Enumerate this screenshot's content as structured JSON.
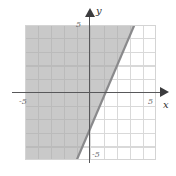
{
  "figure": {
    "kind": "cartesian-graph",
    "background_color": "#ffffff",
    "grid_color": "#d9d9d9",
    "axis_color": "#58585a",
    "line_color": "#8a8a8c",
    "shade_color": "#a8a8a8"
  },
  "axes": {
    "x_label": "x",
    "y_label": "y",
    "x_ticks": [
      "-5",
      "5"
    ],
    "y_ticks": [
      "5",
      "-5"
    ],
    "x_label_left": "-5",
    "x_label_right": "5",
    "y_label_top": "5",
    "y_label_bottom": "-5",
    "xlim": [
      -5,
      5
    ],
    "ylim": [
      -5,
      5
    ],
    "grid": true,
    "grid_step": 1
  },
  "chart_data": {
    "type": "line",
    "title": "",
    "xlabel": "x",
    "ylabel": "y",
    "xlim": [
      -5,
      5
    ],
    "ylim": [
      -5,
      5
    ],
    "grid": true,
    "legend": "none",
    "series": [
      {
        "name": "boundary-line",
        "style": "solid",
        "slope": 2.35,
        "intercept": -2.5,
        "equation": "y = 2.35x - 2.5",
        "x": [
          -1.05,
          3.35
        ],
        "values": [
          -5,
          5
        ],
        "endpoints": [
          [
            -1.05,
            -5
          ],
          [
            3.35,
            5
          ]
        ],
        "x_intercept": 1.06,
        "y_intercept": -2.5
      }
    ],
    "shaded_region": {
      "name": "solution-region",
      "side": "left",
      "inequality": "y >= 2.35x - 2.5",
      "fill": "#a8a8a8",
      "opacity": 0.62
    }
  }
}
